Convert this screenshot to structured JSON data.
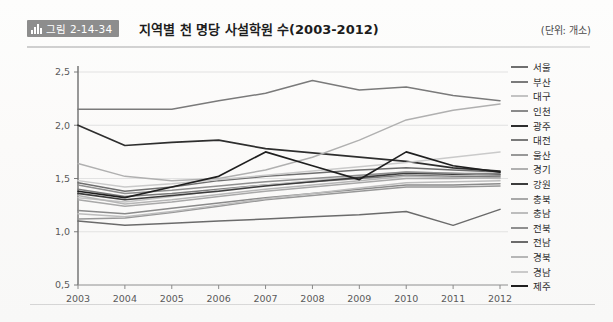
{
  "header": {
    "badge_icon": "bar-chart-icon",
    "badge_label": "그림 2-14-34",
    "title": "지역별 천 명당 사설학원 수(2003-2012)",
    "unit": "(단위: 개소)"
  },
  "chart_data": {
    "type": "line",
    "title": "지역별 천 명당 사설학원 수(2003-2012)",
    "xlabel": "",
    "ylabel": "",
    "unit": "개소",
    "x": [
      2003,
      2004,
      2005,
      2006,
      2007,
      2008,
      2009,
      2010,
      2011,
      2012
    ],
    "categories": [
      "2003",
      "2004",
      "2005",
      "2006",
      "2007",
      "2008",
      "2009",
      "2010",
      "2011",
      "2012"
    ],
    "xlim": [
      2003,
      2012
    ],
    "ylim": [
      0.5,
      2.5
    ],
    "yticks": [
      "0,5",
      "1,0",
      "1,5",
      "2,0",
      "2,5"
    ],
    "ytick_values": [
      0.5,
      1.0,
      1.5,
      2.0,
      2.5
    ],
    "grid": true,
    "legend_position": "right",
    "series": [
      {
        "name": "서울",
        "color": "#6f6f6f",
        "width": 1.5,
        "values": [
          1.46,
          1.38,
          1.42,
          1.48,
          1.52,
          1.55,
          1.58,
          1.6,
          1.58,
          1.56
        ]
      },
      {
        "name": "부산",
        "color": "#7b7b7b",
        "width": 1.5,
        "values": [
          1.4,
          1.33,
          1.36,
          1.4,
          1.44,
          1.47,
          1.5,
          1.53,
          1.52,
          1.52
        ]
      },
      {
        "name": "대구",
        "color": "#c3c3c3",
        "width": 1.5,
        "values": [
          1.32,
          1.28,
          1.33,
          1.39,
          1.44,
          1.48,
          1.52,
          1.56,
          1.55,
          1.55
        ]
      },
      {
        "name": "인천",
        "color": "#8a8a8a",
        "width": 1.5,
        "values": [
          1.2,
          1.17,
          1.22,
          1.27,
          1.32,
          1.36,
          1.4,
          1.44,
          1.44,
          1.45
        ]
      },
      {
        "name": "광주",
        "color": "#2e2e2e",
        "width": 1.7,
        "values": [
          2.0,
          1.81,
          1.84,
          1.86,
          1.78,
          1.74,
          1.7,
          1.66,
          1.6,
          1.57
        ]
      },
      {
        "name": "대전",
        "color": "#7a7a7a",
        "width": 1.5,
        "values": [
          2.15,
          2.15,
          2.15,
          2.23,
          2.3,
          2.42,
          2.33,
          2.36,
          2.28,
          2.23
        ]
      },
      {
        "name": "울산",
        "color": "#989898",
        "width": 1.5,
        "values": [
          1.12,
          1.13,
          1.18,
          1.24,
          1.3,
          1.34,
          1.38,
          1.42,
          1.42,
          1.43
        ]
      },
      {
        "name": "경기",
        "color": "#b0b0b0",
        "width": 1.5,
        "values": [
          1.64,
          1.52,
          1.48,
          1.5,
          1.58,
          1.7,
          1.86,
          2.05,
          2.14,
          2.2
        ]
      },
      {
        "name": "강원",
        "color": "#3c3c3c",
        "width": 1.6,
        "values": [
          1.36,
          1.3,
          1.34,
          1.38,
          1.43,
          1.47,
          1.51,
          1.55,
          1.54,
          1.54
        ]
      },
      {
        "name": "충북",
        "color": "#a8a8a8",
        "width": 1.5,
        "values": [
          1.3,
          1.24,
          1.28,
          1.33,
          1.38,
          1.42,
          1.46,
          1.5,
          1.5,
          1.51
        ]
      },
      {
        "name": "충남",
        "color": "#bdbdbd",
        "width": 1.5,
        "values": [
          1.17,
          1.14,
          1.19,
          1.25,
          1.31,
          1.36,
          1.41,
          1.46,
          1.47,
          1.48
        ]
      },
      {
        "name": "전북",
        "color": "#8f8f8f",
        "width": 1.5,
        "values": [
          1.44,
          1.36,
          1.39,
          1.43,
          1.47,
          1.5,
          1.53,
          1.56,
          1.55,
          1.53
        ]
      },
      {
        "name": "전남",
        "color": "#6b6b6b",
        "width": 1.5,
        "values": [
          1.1,
          1.06,
          1.08,
          1.1,
          1.12,
          1.14,
          1.16,
          1.19,
          1.06,
          1.21
        ]
      },
      {
        "name": "경북",
        "color": "#b6b6b6",
        "width": 1.5,
        "values": [
          1.34,
          1.26,
          1.3,
          1.35,
          1.4,
          1.44,
          1.48,
          1.52,
          1.51,
          1.5
        ]
      },
      {
        "name": "경남",
        "color": "#cacaca",
        "width": 1.5,
        "values": [
          1.48,
          1.42,
          1.45,
          1.49,
          1.53,
          1.57,
          1.61,
          1.65,
          1.7,
          1.75
        ]
      },
      {
        "name": "제주",
        "color": "#1f1f1f",
        "width": 1.7,
        "values": [
          1.38,
          1.32,
          1.42,
          1.52,
          1.75,
          1.62,
          1.49,
          1.75,
          1.62,
          1.56
        ]
      }
    ]
  }
}
